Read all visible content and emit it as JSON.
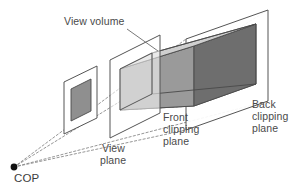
{
  "figure": {
    "background_color": "#ffffff",
    "labels": {
      "view_volume": "View volume",
      "view_plane_line1": "View",
      "view_plane_line2": "plane",
      "front_clipping_line1": "Front",
      "front_clipping_line2": "clipping",
      "front_clipping_line3": "plane",
      "back_clipping_line1": "Back",
      "back_clipping_line2": "clipping",
      "back_clipping_line3": "plane",
      "cop": "COP"
    },
    "colors": {
      "outline": "#4a4a4a",
      "label_text": "#4a4a4a",
      "cop_dot": "#111111",
      "ray_dashed": "#8a8a8a",
      "face_top": "#cfcfcf",
      "face_left": "#9a9a9a",
      "face_back": "#6e6e6e",
      "face_bottom": "#b5b5b5",
      "plane_fill": "#ffffff",
      "view_plane_image": "#8f8f8f",
      "plane_stroke": "#555555"
    },
    "geometry": {
      "cop": {
        "x": 14,
        "y": 167
      },
      "view_plane_quad": [
        {
          "x": 64,
          "y": 82
        },
        {
          "x": 97,
          "y": 66
        },
        {
          "x": 97,
          "y": 118
        },
        {
          "x": 64,
          "y": 134
        }
      ],
      "view_plane_image_quad": [
        {
          "x": 71,
          "y": 89
        },
        {
          "x": 91,
          "y": 79
        },
        {
          "x": 91,
          "y": 111
        },
        {
          "x": 71,
          "y": 121
        }
      ],
      "front_plane_quad": [
        {
          "x": 110,
          "y": 60
        },
        {
          "x": 160,
          "y": 35
        },
        {
          "x": 160,
          "y": 113
        },
        {
          "x": 110,
          "y": 138
        }
      ],
      "back_plane_quad": [
        {
          "x": 186,
          "y": 39
        },
        {
          "x": 268,
          "y": 10
        },
        {
          "x": 268,
          "y": 101
        },
        {
          "x": 186,
          "y": 130
        }
      ],
      "frustum_front_face": [
        {
          "x": 120,
          "y": 69
        },
        {
          "x": 152,
          "y": 53
        },
        {
          "x": 152,
          "y": 94
        },
        {
          "x": 120,
          "y": 110
        }
      ],
      "frustum_back_face": [
        {
          "x": 194,
          "y": 46
        },
        {
          "x": 256,
          "y": 24
        },
        {
          "x": 256,
          "y": 84
        },
        {
          "x": 194,
          "y": 106
        }
      ],
      "label_positions": {
        "view_volume": {
          "x": 64,
          "y": 25
        },
        "view_plane": {
          "x": 102,
          "y": 152
        },
        "front_clipping": {
          "x": 163,
          "y": 121
        },
        "back_clipping": {
          "x": 252,
          "y": 108
        },
        "cop": {
          "x": 16,
          "y": 182
        }
      },
      "leader_view_volume": {
        "x1": 127,
        "y1": 29,
        "x2": 158,
        "y2": 50
      },
      "ray_count": 4
    }
  }
}
